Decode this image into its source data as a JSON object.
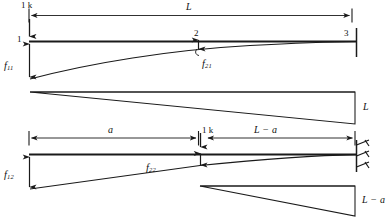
{
  "figure": {
    "type": "structural-beam-deflection-diagram",
    "stroke_color": "#1a1a1a",
    "background_color": "#ffffff"
  },
  "upper_diagram": {
    "name": "case-1-unit-load-at-node-1",
    "load_label": "1 k",
    "span_label": "L",
    "node_left_label": "1",
    "node_mid_label": "2",
    "node_right_label": "3",
    "deflection_left_label_base": "f",
    "deflection_left_label_sub": "11",
    "deflection_mid_label_base": "f",
    "deflection_mid_label_sub": "21",
    "moment_diagram_label": "L"
  },
  "lower_diagram": {
    "name": "case-2-unit-load-at-node-2",
    "load_label": "1 k",
    "dim_left_label": "a",
    "dim_right_label": "L − a",
    "deflection_left_label_base": "f",
    "deflection_left_label_sub": "12",
    "deflection_mid_label_base": "f",
    "deflection_mid_label_sub": "22",
    "moment_diagram_label": "L − a"
  }
}
